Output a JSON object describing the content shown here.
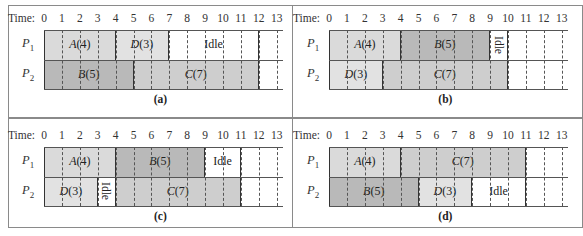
{
  "figure": {
    "time_prefix": "Time: ",
    "ticks": [
      0,
      1,
      2,
      3,
      4,
      5,
      6,
      7,
      8,
      9,
      10,
      11,
      12,
      13
    ],
    "processors": [
      {
        "name": "P",
        "sub": "1"
      },
      {
        "name": "P",
        "sub": "2"
      }
    ],
    "colors": {
      "A": "#dadada",
      "B": "#b9b9b9",
      "C": "#cecece",
      "D": "#e2e2e2",
      "Idle": "#ffffff",
      "grid_line": "#555555",
      "block_border": "#333333",
      "frame": "#8a8a8a"
    }
  },
  "panels": [
    {
      "caption": "(a)",
      "rows": [
        [
          {
            "job": "A",
            "dur": "(4)",
            "start": 0,
            "end": 4
          },
          {
            "job": "D",
            "dur": "(3)",
            "start": 4,
            "end": 7
          },
          {
            "job": "Idle",
            "label": "Idle",
            "start": 7,
            "end": 12,
            "vertical": false
          }
        ],
        [
          {
            "job": "B",
            "dur": "(5)",
            "start": 0,
            "end": 5
          },
          {
            "job": "C",
            "dur": "(7)",
            "start": 5,
            "end": 12
          }
        ]
      ]
    },
    {
      "caption": "(b)",
      "rows": [
        [
          {
            "job": "A",
            "dur": "(4)",
            "start": 0,
            "end": 4
          },
          {
            "job": "B",
            "dur": "(5)",
            "start": 4,
            "end": 9
          },
          {
            "job": "Idle",
            "label": "Idle",
            "start": 9,
            "end": 10,
            "vertical": true
          }
        ],
        [
          {
            "job": "D",
            "dur": "(3)",
            "start": 0,
            "end": 3
          },
          {
            "job": "C",
            "dur": "(7)",
            "start": 3,
            "end": 10
          }
        ]
      ]
    },
    {
      "caption": "(c)",
      "rows": [
        [
          {
            "job": "A",
            "dur": "(4)",
            "start": 0,
            "end": 4
          },
          {
            "job": "B",
            "dur": "(5)",
            "start": 4,
            "end": 9
          },
          {
            "job": "Idle",
            "label": "Idle",
            "start": 9,
            "end": 11,
            "vertical": false
          }
        ],
        [
          {
            "job": "D",
            "dur": "(3)",
            "start": 0,
            "end": 3
          },
          {
            "job": "Idle",
            "label": "Idle",
            "start": 3,
            "end": 4,
            "vertical": true
          },
          {
            "job": "C",
            "dur": "(7)",
            "start": 4,
            "end": 11
          }
        ]
      ]
    },
    {
      "caption": "(d)",
      "rows": [
        [
          {
            "job": "A",
            "dur": "(4)",
            "start": 0,
            "end": 4
          },
          {
            "job": "C",
            "dur": "(7)",
            "start": 4,
            "end": 11
          }
        ],
        [
          {
            "job": "B",
            "dur": "(5)",
            "start": 0,
            "end": 5
          },
          {
            "job": "D",
            "dur": "(3)",
            "start": 5,
            "end": 8
          },
          {
            "job": "Idle",
            "label": "Idle",
            "start": 8,
            "end": 11,
            "vertical": false
          }
        ]
      ]
    }
  ]
}
